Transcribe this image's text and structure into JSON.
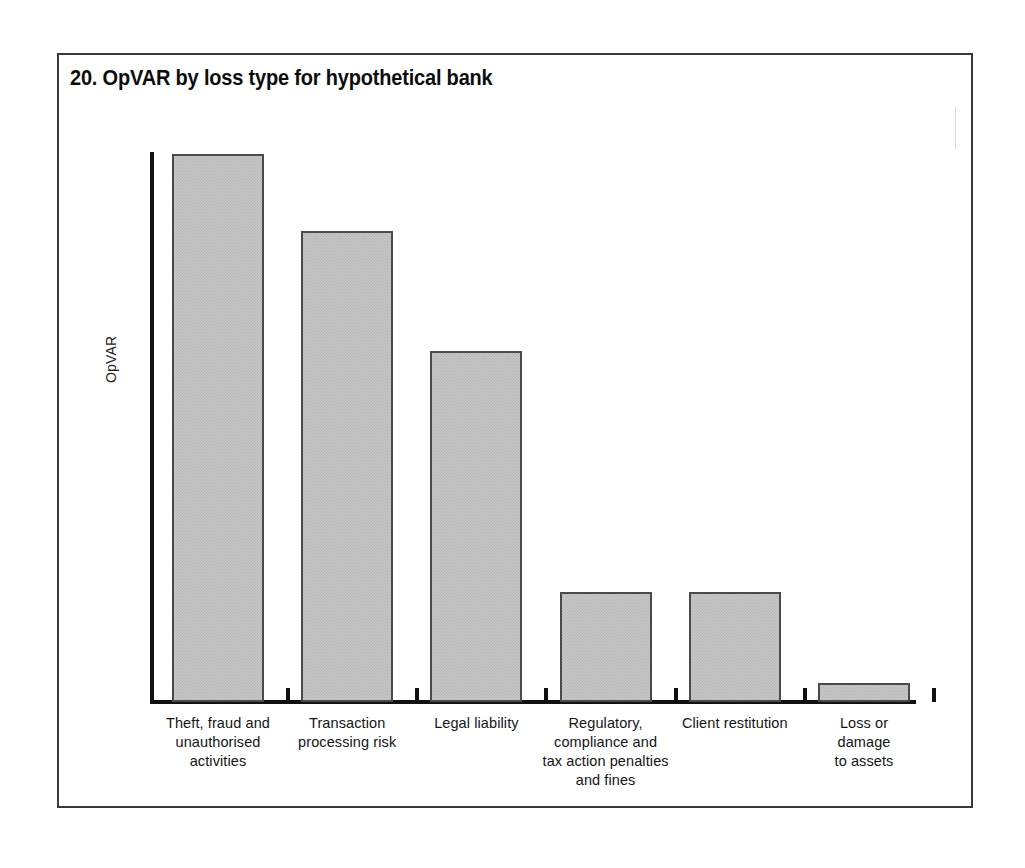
{
  "figure": {
    "title": "20. OpVAR by loss type for hypothetical bank",
    "frame_color": "#3a3a3a",
    "background": "#ffffff"
  },
  "chart_data": {
    "type": "bar",
    "title": "20. OpVAR by loss type for hypothetical bank",
    "xlabel": "",
    "ylabel": "OpVAR",
    "ylim": [
      0,
      100
    ],
    "grid": false,
    "legend": "none",
    "axis_tick_labels": [],
    "bar_fill_color": "#c9c9c9",
    "bar_edge_color": "#4a4a4a",
    "categories": [
      "Theft, fraud and unauthorised activities",
      "Transaction processing risk",
      "Legal liability",
      "Regulatory, compliance and tax action penalties and fines",
      "Client restitution",
      "Loss or damage to assets"
    ],
    "category_lines": [
      [
        "Theft, fraud and",
        "unauthorised",
        "activities"
      ],
      [
        "Transaction",
        "processing risk"
      ],
      [
        "Legal liability"
      ],
      [
        "Regulatory,",
        "compliance and",
        "tax action penalties",
        "and fines"
      ],
      [
        "Client restitution"
      ],
      [
        "Loss or",
        "damage",
        "to assets"
      ]
    ],
    "values": [
      100,
      86,
      64,
      20,
      20,
      3.5
    ]
  }
}
